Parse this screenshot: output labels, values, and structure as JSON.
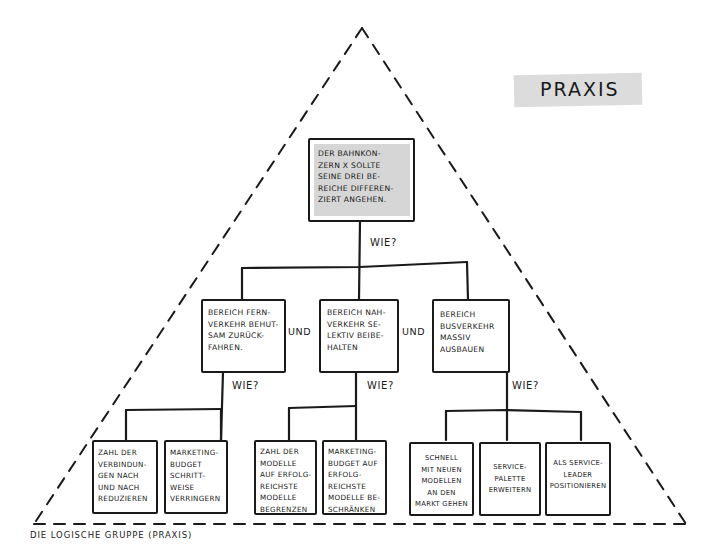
{
  "tag": {
    "label": "PRAXIS"
  },
  "caption": "DIE LOGISCHE GRUPPE (PRAXIS)",
  "connectors": {
    "how": "WIE?",
    "and": "UND"
  },
  "colors": {
    "ink": "#1a1a1a",
    "highlight": "#d6d6d6",
    "background": "#ffffff"
  },
  "tree": {
    "root": {
      "text": "DER BAHNKON-\nZERN X SOLLTE\nSEINE DREI BE-\nREICHE DIFFEREN-\nZIERT ANGEHEN."
    },
    "level2": [
      {
        "text": "BEREICH FERN-\nVERKEHR BEHUT-\nSAM ZURÜCK-\nFAHREN."
      },
      {
        "text": "BEREICH NAH-\nVERKEHR SE-\nLEKTIV BEIBE-\nHALTEN"
      },
      {
        "text": "BEREICH\nBUSVERKEHR\nMASSIV\nAUSBAUEN"
      }
    ],
    "level3": [
      {
        "text": "ZAHL DER\nVERBINDUN-\nGEN NACH\nUND NACH\nREDUZIEREN"
      },
      {
        "text": "MARKETING-\nBUDGET\nSCHRITT-\nWEISE\nVERRINGERN"
      },
      {
        "text": "ZAHL DER\nMODELLE\nAUF ERFOLG-\nREICHSTE\nMODELLE\nBEGRENZEN"
      },
      {
        "text": "MARKETING-\nBUDGET AUF\nERFOLG-\nREICHSTE\nMODELLE BE-\nSCHRÄNKEN"
      },
      {
        "text": "SCHNELL\nMIT NEUEN\nMODELLEN\nAN DEN\nMARKT GEHEN"
      },
      {
        "text": "SERVICE-\nPALETTE\nERWEITERN"
      },
      {
        "text": "ALS SERVICE-\nLEADER\nPOSITIONIEREN"
      }
    ]
  }
}
